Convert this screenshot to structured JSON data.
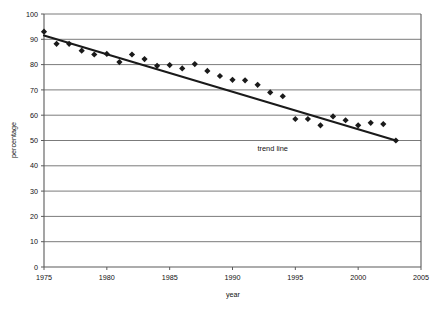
{
  "chart_data": {
    "type": "scatter",
    "title": "",
    "xlabel": "year",
    "ylabel": "percentage",
    "xlim": [
      1975,
      2005
    ],
    "ylim": [
      0,
      100
    ],
    "xticks": [
      1975,
      1980,
      1985,
      1990,
      1995,
      2000,
      2005
    ],
    "xticklabels": [
      "1975",
      "1980",
      "1985",
      "1990",
      "1995",
      "2000",
      "2005"
    ],
    "yticks": [
      0,
      10,
      20,
      30,
      40,
      50,
      60,
      70,
      80,
      90,
      100
    ],
    "yticklabels": [
      "0",
      "10",
      "20",
      "30",
      "40",
      "50",
      "60",
      "70",
      "80",
      "90",
      "100"
    ],
    "grid": "horizontal",
    "legend": "none",
    "marker": "diamond",
    "marker_color": "#1a1a1a",
    "series": [
      {
        "name": "percentage",
        "type": "scatter",
        "x": [
          1975,
          1976,
          1977,
          1978,
          1979,
          1980,
          1981,
          1982,
          1983,
          1984,
          1985,
          1986,
          1987,
          1988,
          1989,
          1990,
          1991,
          1992,
          1993,
          1994,
          1995,
          1996,
          1997,
          1998,
          1999,
          2000,
          2001,
          2002,
          2003
        ],
        "y": [
          93.0,
          88.2,
          88.2,
          85.5,
          84.0,
          84.2,
          81.0,
          84.0,
          82.2,
          79.5,
          79.8,
          78.5,
          80.2,
          77.5,
          75.5,
          74.0,
          73.8,
          72.0,
          69.0,
          67.5,
          58.5,
          58.5,
          56.0,
          59.5,
          58.0,
          56.0,
          57.0,
          56.5,
          50.0
        ]
      },
      {
        "name": "trend line",
        "type": "line",
        "x": [
          1975,
          2003
        ],
        "y": [
          91.5,
          50.0
        ],
        "color": "#1a1a1a",
        "width": 2.1
      }
    ],
    "annotations": [
      {
        "text": "trend line",
        "x": 1993.2,
        "y": 46.0
      }
    ]
  },
  "axes": {
    "xlabel": "year",
    "ylabel": "percentage"
  },
  "style": {
    "background": "#ffffff",
    "grid_color": "#7b7b7b",
    "axis_color": "#5a5a5a",
    "text_color": "#111111",
    "marker_color": "#1a1a1a",
    "trend_color": "#1a1a1a"
  }
}
